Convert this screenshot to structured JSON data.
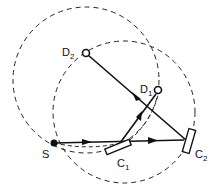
{
  "diagram": {
    "type": "optical-path-geometry",
    "labels": {
      "source": "S",
      "detector1": "D",
      "detector1_sub": "1",
      "detector2": "D",
      "detector2_sub": "2",
      "crystal1": "C",
      "crystal1_sub": "1",
      "crystal2": "C",
      "crystal2_sub": "2"
    },
    "nodes": {
      "S": {
        "x": 54,
        "y": 143
      },
      "D1": {
        "x": 158,
        "y": 90
      },
      "D2": {
        "x": 85,
        "y": 52
      },
      "C1": {
        "x": 118,
        "y": 146
      },
      "C2": {
        "x": 186,
        "y": 141
      }
    },
    "circles": [
      {
        "name": "focusing-circle-1",
        "cx": 86,
        "cy": 80,
        "r": 73,
        "style": "dashed"
      },
      {
        "name": "focusing-circle-2",
        "cx": 124,
        "cy": 112,
        "r": 71,
        "style": "dashed"
      }
    ],
    "colors": {
      "stroke": "#111111",
      "background": "#ffffff"
    }
  }
}
